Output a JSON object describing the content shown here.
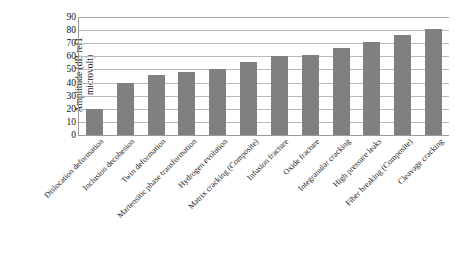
{
  "chart_data": {
    "type": "bar",
    "title": "",
    "xlabel": "",
    "ylabel": "Amplitude (dB ref1\nmicrovolt)",
    "ylim": [
      0,
      90
    ],
    "ytick_labels": [
      "0",
      "10",
      "20",
      "30",
      "40",
      "50",
      "60",
      "70",
      "80",
      "90"
    ],
    "ytick_values": [
      0,
      10,
      20,
      30,
      40,
      50,
      60,
      70,
      80,
      90
    ],
    "grid": true,
    "legend": false,
    "bar_color": "#808080",
    "categories": [
      "Dislocation deformation",
      "Inclusion decohesion",
      "Twin deformation",
      "Martensitic phase transformation",
      "Hydrogen evolution",
      "Matrix cracking (Composite)",
      "Infusion fracture",
      "Oxide fracture",
      "Integranular cracking",
      "High pressure leaks",
      "Fiber breaking (Composite)",
      "Cleavage cracking"
    ],
    "values": [
      20,
      40,
      46,
      48,
      50,
      56,
      60,
      61,
      66,
      71,
      76,
      81
    ]
  }
}
